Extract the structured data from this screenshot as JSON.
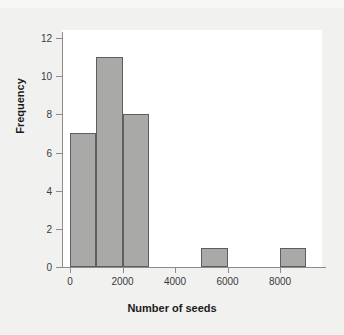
{
  "chart_data": {
    "type": "bar",
    "title": "",
    "subtitle": "",
    "xlabel": "Number of seeds",
    "ylabel": "Frequency",
    "xlim": [
      -500,
      9500
    ],
    "ylim": [
      0,
      12
    ],
    "grid": false,
    "legend": null,
    "bin_width": 1000,
    "x_ticks": [
      0,
      2000,
      4000,
      6000,
      8000
    ],
    "x_tick_labels": [
      "0",
      "2000",
      "4000",
      "6000",
      "8000"
    ],
    "y_ticks": [
      0,
      2,
      4,
      6,
      8,
      10,
      12
    ],
    "y_tick_labels": [
      "0",
      "2",
      "4",
      "6",
      "8",
      "10",
      "12"
    ],
    "bins": [
      {
        "label": "0-1000",
        "start": 0,
        "end": 1000,
        "value": 7
      },
      {
        "label": "1000-2000",
        "start": 1000,
        "end": 2000,
        "value": 11
      },
      {
        "label": "2000-3000",
        "start": 2000,
        "end": 3000,
        "value": 8
      },
      {
        "label": "3000-4000",
        "start": 3000,
        "end": 4000,
        "value": 0
      },
      {
        "label": "4000-5000",
        "start": 4000,
        "end": 5000,
        "value": 0
      },
      {
        "label": "5000-6000",
        "start": 5000,
        "end": 6000,
        "value": 1
      },
      {
        "label": "6000-7000",
        "start": 6000,
        "end": 7000,
        "value": 0
      },
      {
        "label": "7000-8000",
        "start": 7000,
        "end": 8000,
        "value": 0
      },
      {
        "label": "8000-9000",
        "start": 8000,
        "end": 9000,
        "value": 1
      }
    ],
    "categories": [
      "0-1000",
      "1000-2000",
      "2000-3000",
      "3000-4000",
      "4000-5000",
      "5000-6000",
      "6000-7000",
      "7000-8000",
      "8000-9000"
    ],
    "values": [
      7,
      11,
      8,
      0,
      0,
      1,
      0,
      0,
      1
    ],
    "colors": {
      "bar_fill": "#a9a9a8",
      "bar_border": "#5e5e5e",
      "axis": "#8c8c8c",
      "panel_background": "#ffffff",
      "figure_background": "#f1f1f0",
      "tick_label": "#3b3b3b",
      "axis_title": "#1b1b1b"
    }
  }
}
